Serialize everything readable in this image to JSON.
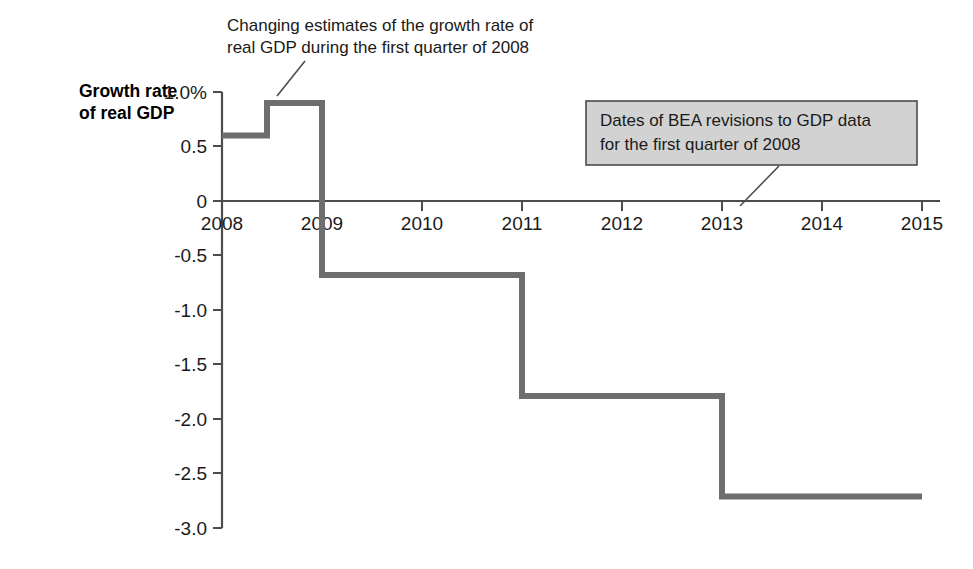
{
  "chart_data": {
    "type": "line",
    "subtype": "step",
    "title": "",
    "xlabel": "",
    "ylabel": "Growth rate of real GDP",
    "xlim": [
      2008,
      2015
    ],
    "ylim": [
      -3.0,
      1.0
    ],
    "grid": false,
    "legend": "none",
    "x_ticks": [
      "2008",
      "2009",
      "2010",
      "2011",
      "2012",
      "2013",
      "2014",
      "2015"
    ],
    "x_tick_values": [
      2008,
      2009,
      2010,
      2011,
      2012,
      2013,
      2014,
      2015
    ],
    "y_ticks": [
      "1.0%",
      "0.5",
      "0",
      "-0.5",
      "-1.0",
      "-1.5",
      "-2.0",
      "-2.5",
      "-3.0"
    ],
    "y_tick_values": [
      1.0,
      0.5,
      0,
      -0.5,
      -1.0,
      -1.5,
      -2.0,
      -2.5,
      -3.0
    ],
    "series": [
      {
        "name": "Growth rate of real GDP, first quarter of 2008",
        "color": "#6e6e6e",
        "steps": [
          {
            "x_start": 2008.0,
            "x_end": 2008.45,
            "y": 0.6
          },
          {
            "x_start": 2008.45,
            "x_end": 2009.0,
            "y": 0.9
          },
          {
            "x_start": 2009.0,
            "x_end": 2011.0,
            "y": -0.68
          },
          {
            "x_start": 2011.0,
            "x_end": 2013.0,
            "y": -1.79
          },
          {
            "x_start": 2013.0,
            "x_end": 2015.0,
            "y": -2.71
          }
        ]
      }
    ],
    "annotations": [
      {
        "id": "estimates-callout",
        "lines": [
          "Changing estimates of the growth rate of",
          "real GDP during the first quarter of 2008"
        ],
        "boxed": false,
        "leader_from": [
          305,
          60
        ],
        "leader_to": [
          277,
          95
        ]
      },
      {
        "id": "bea-revisions-callout",
        "lines": [
          "Dates of BEA revisions to GDP data",
          "for the first quarter of 2008"
        ],
        "boxed": true,
        "box_fill": "#d2d2d2",
        "box_stroke": "#4a4a4a",
        "leader_from": [
          779,
          166
        ],
        "leader_to": [
          740,
          205
        ]
      }
    ]
  },
  "axis": {
    "y_title_line1": "Growth rate",
    "y_title_line2": "of real GDP"
  },
  "colors": {
    "line": "#6e6e6e",
    "axis": "#4d4d4d",
    "text": "#1a1a1a",
    "box_fill": "#d2d2d2",
    "box_stroke": "#4a4a4a",
    "background": "#ffffff"
  }
}
